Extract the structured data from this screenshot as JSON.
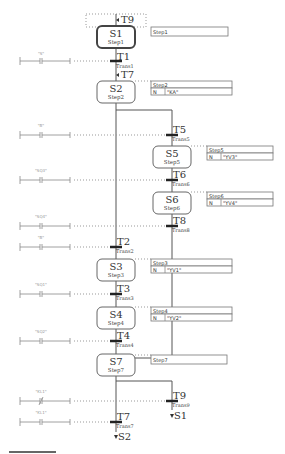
{
  "diagram": {
    "type": "SFC",
    "initial_jump": "T9",
    "steps": [
      {
        "id": "S1",
        "name": "Step1",
        "initial": true,
        "comment": "Step1",
        "actions": []
      },
      {
        "id": "S2",
        "name": "Step2",
        "comment": "Step2",
        "actions": [
          {
            "qualifier": "N",
            "action": "\"KA\""
          }
        ]
      },
      {
        "id": "S5",
        "name": "Step5",
        "comment": "Step5",
        "actions": [
          {
            "qualifier": "N",
            "action": "\"YV3\""
          }
        ]
      },
      {
        "id": "S6",
        "name": "Step6",
        "comment": "Step6",
        "actions": [
          {
            "qualifier": "N",
            "action": "\"YV4\""
          }
        ]
      },
      {
        "id": "S3",
        "name": "Step3",
        "comment": "Step3",
        "actions": [
          {
            "qualifier": "N",
            "action": "\"YV1\""
          }
        ]
      },
      {
        "id": "S4",
        "name": "Step4",
        "comment": "Step4",
        "actions": [
          {
            "qualifier": "N",
            "action": "\"YV2\""
          }
        ]
      },
      {
        "id": "S7",
        "name": "Step7",
        "comment": "Step7",
        "actions": []
      }
    ],
    "transitions": [
      {
        "id": "T1",
        "name": "Trans1",
        "contact": "\"S\"",
        "contact_type": "NO"
      },
      {
        "id": "T5",
        "name": "Trans5",
        "contact": "\"B\"",
        "contact_type": "NO"
      },
      {
        "id": "T6",
        "name": "Trans6",
        "contact": "\"SQ3\"",
        "contact_type": "NO"
      },
      {
        "id": "T8",
        "name": "Trans8",
        "contact": "\"SQ4\"",
        "contact_type": "NO"
      },
      {
        "id": "T2",
        "name": "Trans2",
        "contact": "\"B\"",
        "contact_type": "NO"
      },
      {
        "id": "T3",
        "name": "Trans3",
        "contact": "\"SQ1\"",
        "contact_type": "NO"
      },
      {
        "id": "T4",
        "name": "Trans4",
        "contact": "\"SQ2\"",
        "contact_type": "NO"
      },
      {
        "id": "T9",
        "name": "Trans9",
        "contact": "\"KL1\"",
        "contact_type": "NC"
      },
      {
        "id": "T7",
        "name": "Trans7",
        "contact": "\"KL1\"",
        "contact_type": "NO"
      }
    ],
    "jumps_in": {
      "S2": "T7"
    },
    "jumps_out": {
      "T9": "S1",
      "T7": "S2"
    }
  },
  "labels": {
    "s1": "S1",
    "s1n": "Step1",
    "s1c": "Step1",
    "s2": "S2",
    "s2n": "Step2",
    "s2c": "Step2",
    "s2q": "N",
    "s2a": "\"KA\"",
    "s5": "S5",
    "s5n": "Step5",
    "s5c": "Step5",
    "s5q": "N",
    "s5a": "\"YV3\"",
    "s6": "S6",
    "s6n": "Step6",
    "s6c": "Step6",
    "s6q": "N",
    "s6a": "\"YV4\"",
    "s3": "S3",
    "s3n": "Step3",
    "s3c": "Step3",
    "s3q": "N",
    "s3a": "\"YV1\"",
    "s4": "S4",
    "s4n": "Step4",
    "s4c": "Step4",
    "s4q": "N",
    "s4a": "\"YV2\"",
    "s7": "S7",
    "s7n": "Step7",
    "s7c": "Step7",
    "t1": "T1",
    "t1n": "Trans1",
    "t1c": "\"S\"",
    "t5": "T5",
    "t5n": "Trans5",
    "t5c": "\"B\"",
    "t6": "T6",
    "t6n": "Trans6",
    "t6c": "\"SQ3\"",
    "t8": "T8",
    "t8n": "Trans8",
    "t8c": "\"SQ4\"",
    "t2": "T2",
    "t2n": "Trans2",
    "t2c": "\"B\"",
    "t3": "T3",
    "t3n": "Trans3",
    "t3c": "\"SQ1\"",
    "t4": "T4",
    "t4n": "Trans4",
    "t4c": "\"SQ2\"",
    "t9": "T9",
    "t9n": "Trans9",
    "t9c": "\"KL1\"",
    "t7": "T7",
    "t7n": "Trans7",
    "t7c": "\"KL1\"",
    "jin_t9": "T9",
    "jin_t7": "T7",
    "jout_s1": "S1",
    "jout_s2": "S2"
  }
}
